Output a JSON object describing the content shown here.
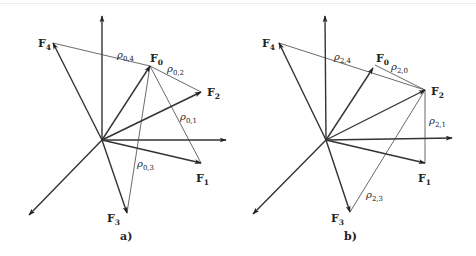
{
  "figure": {
    "panels": [
      {
        "id": "a",
        "caption": "a)",
        "origin": [
          102,
          140
        ],
        "axes": {
          "x_end": [
            226,
            140
          ],
          "y_end": [
            102,
            16
          ],
          "diag_end": [
            29,
            215
          ]
        },
        "vectors": [
          {
            "name": "F",
            "sub": "0",
            "tip": [
              150,
              66
            ],
            "label_pos": [
              150,
              62
            ]
          },
          {
            "name": "F",
            "sub": "1",
            "tip": [
              201,
              163
            ],
            "label_pos": [
              196,
              182
            ]
          },
          {
            "name": "F",
            "sub": "2",
            "tip": [
              201,
              92
            ],
            "label_pos": [
              207,
              96
            ]
          },
          {
            "name": "F",
            "sub": "3",
            "tip": [
              127,
              213
            ],
            "label_pos": [
              107,
              222
            ]
          },
          {
            "name": "F",
            "sub": "4",
            "tip": [
              53,
              43
            ],
            "label_pos": [
              38,
              47
            ]
          }
        ],
        "distances": [
          {
            "rho": "ρ",
            "sub": "0,4",
            "from": [
              150,
              66
            ],
            "to": [
              53,
              43
            ],
            "label_pos": [
              117,
              58
            ]
          },
          {
            "rho": "ρ",
            "sub": "0,2",
            "from": [
              150,
              66
            ],
            "to": [
              201,
              92
            ],
            "label_pos": [
              167,
              72
            ]
          },
          {
            "rho": "ρ",
            "sub": "0,1",
            "from": [
              150,
              66
            ],
            "to": [
              201,
              163
            ],
            "label_pos": [
              180,
              120
            ]
          },
          {
            "rho": "ρ",
            "sub": "0,3",
            "from": [
              150,
              66
            ],
            "to": [
              127,
              213
            ],
            "label_pos": [
              137,
              167
            ]
          }
        ]
      },
      {
        "id": "b",
        "caption": "b)",
        "origin": [
          326,
          140
        ],
        "axes": {
          "x_end": [
            452,
            138
          ],
          "y_end": [
            325,
            16
          ],
          "diag_end": [
            253,
            214
          ]
        },
        "vectors": [
          {
            "name": "F",
            "sub": "0",
            "tip": [
              373,
              68
            ],
            "label_pos": [
              376,
              62
            ]
          },
          {
            "name": "F",
            "sub": "1",
            "tip": [
              425,
              163
            ],
            "label_pos": [
              418,
              182
            ]
          },
          {
            "name": "F",
            "sub": "2",
            "tip": [
              425,
              90
            ],
            "label_pos": [
              431,
              95
            ]
          },
          {
            "name": "F",
            "sub": "3",
            "tip": [
              350,
              212
            ],
            "label_pos": [
              331,
              222
            ]
          },
          {
            "name": "F",
            "sub": "4",
            "tip": [
              279,
              43
            ],
            "label_pos": [
              262,
              47
            ]
          }
        ],
        "distances": [
          {
            "rho": "ρ",
            "sub": "2,4",
            "from": [
              425,
              90
            ],
            "to": [
              279,
              43
            ],
            "label_pos": [
              334,
              60
            ]
          },
          {
            "rho": "ρ",
            "sub": "2,0",
            "from": [
              425,
              90
            ],
            "to": [
              375,
              65
            ],
            "label_pos": [
              391,
              70
            ]
          },
          {
            "rho": "ρ",
            "sub": "2,1",
            "from": [
              425,
              90
            ],
            "to": [
              425,
              163
            ],
            "label_pos": [
              429,
              124
            ]
          },
          {
            "rho": "ρ",
            "sub": "2,3",
            "from": [
              425,
              90
            ],
            "to": [
              350,
              212
            ],
            "label_pos": [
              366,
              198
            ]
          }
        ]
      }
    ]
  }
}
